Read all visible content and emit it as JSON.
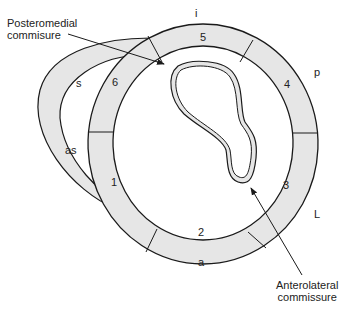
{
  "diagram": {
    "type": "anatomical cross-section",
    "callouts": {
      "posteromedial": {
        "line1": "Posteromedial",
        "line2": "commisure"
      },
      "anterolateral": {
        "line1": "Anterolateral",
        "line2": "commissure"
      }
    },
    "segments": [
      "1",
      "2",
      "3",
      "4",
      "5",
      "6"
    ],
    "orientation_labels": {
      "inferior": "i",
      "posterior": "p",
      "lateral": "L",
      "anterior": "a",
      "septal": "s",
      "anteroseptal": "as"
    },
    "colors": {
      "fill": "#e6e6e6",
      "stroke": "#1a1a1a",
      "background": "#ffffff"
    }
  }
}
